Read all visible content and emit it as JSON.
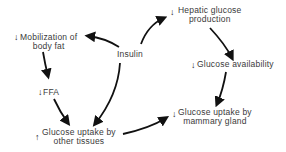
{
  "diagram": {
    "type": "flow",
    "nodes": [
      {
        "id": "insulin",
        "label": "Insulin",
        "indicator": ""
      },
      {
        "id": "mobilization",
        "line1": "Mobilization of",
        "line2": "body fat",
        "indicator": "↓"
      },
      {
        "id": "hepatic",
        "line1": "Hepatic glucose",
        "line2": "production",
        "indicator": "↓"
      },
      {
        "id": "ffa",
        "label": "FFA",
        "indicator": "↓"
      },
      {
        "id": "glucose_availability",
        "label": "Glucose availability",
        "indicator": "↓"
      },
      {
        "id": "uptake_other",
        "line1": "Glucose uptake by",
        "line2": "other tissues",
        "indicator": "↑"
      },
      {
        "id": "uptake_mammary",
        "line1": "Glucose uptake by",
        "line2": "mammary gland",
        "indicator": "↓"
      }
    ],
    "edges": [
      {
        "from": "insulin",
        "to": "mobilization"
      },
      {
        "from": "insulin",
        "to": "hepatic"
      },
      {
        "from": "insulin",
        "to": "uptake_other"
      },
      {
        "from": "mobilization",
        "to": "ffa"
      },
      {
        "from": "ffa",
        "to": "uptake_other"
      },
      {
        "from": "hepatic",
        "to": "glucose_availability"
      },
      {
        "from": "glucose_availability",
        "to": "uptake_mammary"
      },
      {
        "from": "uptake_other",
        "to": "uptake_mammary"
      }
    ],
    "colors": {
      "arrow": "#111111",
      "text": "#3a3a3a"
    }
  }
}
